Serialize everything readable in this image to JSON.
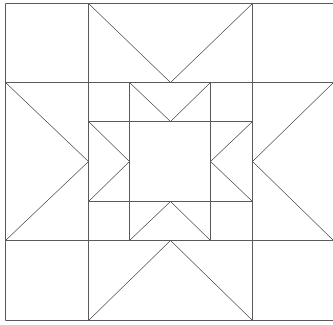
{
  "diagram": {
    "title": "",
    "type": "quilt-block-star-pattern",
    "stroke_color": "#5a5a5a",
    "background": "#ffffff",
    "outer_grid": {
      "x": [
        5,
        88,
        252,
        333
      ],
      "y": [
        3,
        82,
        240,
        320
      ]
    },
    "inner_grid": {
      "x": [
        88,
        129,
        210,
        252
      ],
      "y": [
        82,
        121,
        201,
        240
      ]
    },
    "lines": [
      [
        5,
        3,
        333,
        3
      ],
      [
        5,
        320,
        333,
        320
      ],
      [
        5,
        3,
        5,
        320
      ],
      [
        5,
        82,
        333,
        82
      ],
      [
        5,
        240,
        333,
        240
      ],
      [
        88,
        3,
        88,
        320
      ],
      [
        252,
        3,
        252,
        320
      ],
      [
        88,
        3,
        170,
        82
      ],
      [
        252,
        3,
        170,
        82
      ],
      [
        88,
        320,
        170,
        240
      ],
      [
        252,
        320,
        170,
        240
      ],
      [
        5,
        82,
        88,
        161
      ],
      [
        5,
        240,
        88,
        161
      ],
      [
        333,
        82,
        252,
        161
      ],
      [
        333,
        240,
        252,
        161
      ],
      [
        88,
        121,
        252,
        121
      ],
      [
        88,
        201,
        252,
        201
      ],
      [
        129,
        82,
        129,
        240
      ],
      [
        210,
        82,
        210,
        240
      ],
      [
        129,
        82,
        170,
        121
      ],
      [
        210,
        82,
        170,
        121
      ],
      [
        129,
        240,
        170,
        201
      ],
      [
        210,
        240,
        170,
        201
      ],
      [
        88,
        121,
        129,
        161
      ],
      [
        88,
        201,
        129,
        161
      ],
      [
        252,
        121,
        210,
        161
      ],
      [
        252,
        201,
        210,
        161
      ]
    ]
  }
}
